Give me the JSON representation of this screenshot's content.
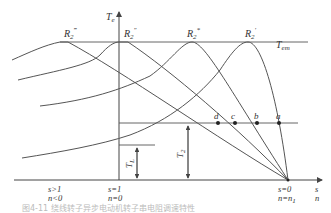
{
  "diagram": {
    "type": "torque-speed characteristic, rotor resistance speed control",
    "axes": {
      "y_label": "T",
      "y_label_sub": "e",
      "x_label_s": "s",
      "x_label_n": "n"
    },
    "curves": [
      {
        "label": "R",
        "sub": "2",
        "sup": "‴"
      },
      {
        "label": "R",
        "sub": "2",
        "sup": "″"
      },
      {
        "label": "R",
        "sub": "2",
        "sup": "*"
      },
      {
        "label": "R",
        "sub": "2",
        "sup": "′"
      }
    ],
    "levels": {
      "max_torque": {
        "label": "T",
        "sub": "em"
      },
      "load_torque_2": {
        "label": "T",
        "sub": "2"
      },
      "load_torque_L": {
        "label": "T",
        "sub": "L"
      }
    },
    "operating_points": [
      "d",
      "c",
      "b",
      "a"
    ],
    "x_ticks": [
      {
        "s": "s>1",
        "n": "n<0"
      },
      {
        "s": "s=1",
        "n": "n=0"
      },
      {
        "s": "s=0",
        "n": "n=n",
        "n_sub": "1"
      }
    ],
    "caption": "图4-11 绕线转子异步电动机转子串电阻调速特性"
  }
}
